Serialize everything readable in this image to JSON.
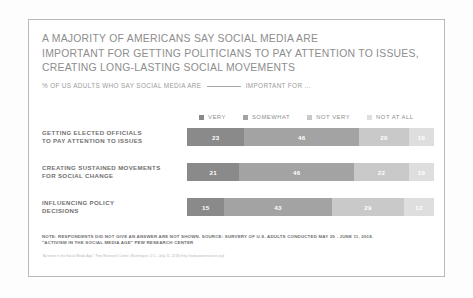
{
  "chart_data": {
    "type": "bar",
    "orientation": "horizontal-stacked",
    "title": "A MAJORITY OF AMERICANS SAY SOCIAL MEDIA ARE IMPORTANT FOR GETTING POLITICIANS TO PAY ATTENTION TO ISSUES, CREATING LONG-LASTING SOCIAL MOVEMENTS",
    "title_lines": [
      "A MAJORITY OF AMERICANS SAY SOCIAL MEDIA ARE",
      "IMPORTANT FOR GETTING POLITICIANS TO PAY ATTENTION TO ISSUES,",
      "CREATING LONG-LASTING SOCIAL MOVEMENTS"
    ],
    "subtitle_before": "% OF US ADULTS  WHO SAY SOCIAL MEDIA ARE",
    "subtitle_after": "IMPORTANT FOR ...",
    "xlabel": "",
    "ylabel": "",
    "xlim": [
      0,
      100
    ],
    "grid": false,
    "legend_position": "top",
    "categories": [
      "GETTING ELECTED OFFICIALS TO PAY ATTENTION TO ISSUES",
      "CREATING SUSTAINED MOVEMENTS FOR SOCIAL CHANGE",
      "INFLUENCING POLICY DECISIONS"
    ],
    "category_lines": [
      [
        "GETTING ELECTED OFFICIALS",
        "TO PAY ATTENTION TO ISSUES"
      ],
      [
        "CREATING SUSTAINED MOVEMENTS",
        "FOR SOCIAL CHANGE"
      ],
      [
        "INFLUENCING POLICY",
        "DECISIONS"
      ]
    ],
    "series": [
      {
        "name": "VERY",
        "color": "#8a8a8a",
        "values": [
          23,
          21,
          15
        ]
      },
      {
        "name": "SOMEWHAT",
        "color": "#a3a3a3",
        "values": [
          46,
          46,
          43
        ]
      },
      {
        "name": "NOT VERY",
        "color": "#c9c9c9",
        "values": [
          20,
          22,
          29
        ]
      },
      {
        "name": "NOT AT ALL",
        "color": "#dedede",
        "values": [
          10,
          10,
          12
        ]
      }
    ],
    "rows": [
      {
        "label_lines": [
          "GETTING ELECTED OFFICIALS",
          "TO PAY ATTENTION TO ISSUES"
        ],
        "segments": [
          {
            "name": "VERY",
            "value": 23
          },
          {
            "name": "SOMEWHAT",
            "value": 46
          },
          {
            "name": "NOT VERY",
            "value": 20
          },
          {
            "name": "NOT AT ALL",
            "value": 10
          }
        ]
      },
      {
        "label_lines": [
          "CREATING SUSTAINED MOVEMENTS",
          "FOR SOCIAL CHANGE"
        ],
        "segments": [
          {
            "name": "VERY",
            "value": 21
          },
          {
            "name": "SOMEWHAT",
            "value": 46
          },
          {
            "name": "NOT VERY",
            "value": 22
          },
          {
            "name": "NOT AT ALL",
            "value": 10
          }
        ]
      },
      {
        "label_lines": [
          "INFLUENCING POLICY",
          "DECISIONS"
        ],
        "segments": [
          {
            "name": "VERY",
            "value": 15
          },
          {
            "name": "SOMEWHAT",
            "value": 43
          },
          {
            "name": "NOT VERY",
            "value": 29
          },
          {
            "name": "NOT AT ALL",
            "value": 12
          }
        ]
      }
    ],
    "notes": [
      "NOTE: RESPONDENTS DID NOT GIVE AN ANSWER ARE NOT SHOWN. SOURCE: SURVERY OF U.S. ADULTS CONDUCTED MAY 29 - JUNE 11, 2018.",
      "\"ACTIVISM IN THE SOCIAL MEDIA AGE\" PEW RESEARCH CENTER"
    ],
    "citation": "\"Activism in the Social Media Age.\" Pew Research Center, Washington, D.C. (July 11, 2018) http://www.pewresearch.org/"
  },
  "colors": {
    "very": "#8a8a8a",
    "somewhat": "#a3a3a3",
    "not_very": "#c9c9c9",
    "not_at_all": "#dedede",
    "title_text": "#8d8d8d",
    "label_text": "#6f6f6f",
    "frame_border": "#b9b9b9"
  }
}
